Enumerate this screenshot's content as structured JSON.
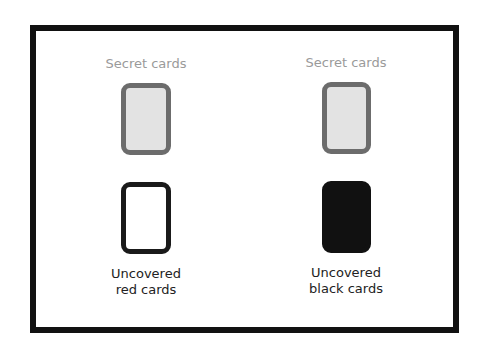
{
  "columns": [
    {
      "top_label": "Secret cards",
      "bottom_label_line1": "Uncovered",
      "bottom_label_line2": "red cards",
      "top_card": "secret",
      "bottom_card": "red"
    },
    {
      "top_label": "Secret cards",
      "bottom_label_line1": "Uncovered",
      "bottom_label_line2": "black cards",
      "top_card": "secret",
      "bottom_card": "black"
    }
  ],
  "colors": {
    "frame": "#111111",
    "secret_fill": "#e3e3e3",
    "secret_border": "#6c6c6c",
    "label_gray": "#9a9a9a",
    "black_card": "#111111"
  }
}
